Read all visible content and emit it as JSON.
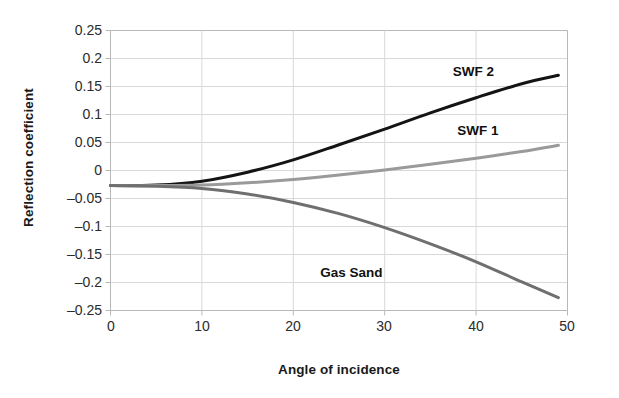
{
  "chart_data": {
    "type": "line",
    "title": "",
    "xlabel": "Angle of incidence",
    "ylabel": "Reflection coefficient",
    "xlim": [
      0,
      50
    ],
    "ylim": [
      -0.25,
      0.25
    ],
    "xticks": [
      0,
      10,
      20,
      30,
      40,
      50
    ],
    "xtick_labels": [
      "0",
      "10",
      "20",
      "30",
      "40",
      "50"
    ],
    "yticks": [
      0.25,
      0.2,
      0.15,
      0.1,
      0.05,
      0,
      -0.05,
      -0.1,
      -0.15,
      -0.2,
      -0.25
    ],
    "ytick_labels": [
      "0.25",
      "0.2",
      "0.15",
      "0.1",
      "0.05",
      "0",
      "–0.05",
      "–0.1",
      "–0.15",
      "–0.2",
      "–0.25"
    ],
    "grid": true,
    "legend_position": "inline-annotations",
    "x": [
      0,
      5,
      10,
      15,
      20,
      25,
      30,
      35,
      40,
      45,
      49
    ],
    "series": [
      {
        "name": "SWF 2",
        "color": "#141414",
        "width": 3.0,
        "values": [
          -0.027,
          -0.026,
          -0.019,
          -0.003,
          0.019,
          0.046,
          0.074,
          0.103,
          0.13,
          0.155,
          0.17
        ],
        "label_x": 40.5,
        "label_y": 0.175
      },
      {
        "name": "SWF 1",
        "color": "#9a9a9a",
        "width": 3.0,
        "values": [
          -0.027,
          -0.027,
          -0.026,
          -0.022,
          -0.016,
          -0.008,
          0.001,
          0.011,
          0.022,
          0.034,
          0.045
        ],
        "label_x": 41.0,
        "label_y": 0.068
      },
      {
        "name": "Gas Sand",
        "color": "#6f6f6f",
        "width": 3.0,
        "values": [
          -0.027,
          -0.028,
          -0.032,
          -0.042,
          -0.057,
          -0.077,
          -0.102,
          -0.131,
          -0.163,
          -0.199,
          -0.227
        ],
        "label_x": 26.0,
        "label_y": -0.185
      }
    ],
    "axis_color": "#b8b8b8",
    "grid_color": "#d8d8d8",
    "background": "#ffffff"
  }
}
